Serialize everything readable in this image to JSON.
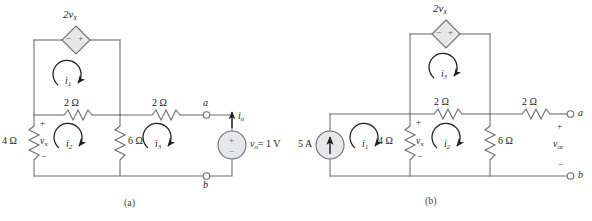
{
  "figure": {
    "type": "circuit-diagram",
    "background": "#ffffff",
    "wire_color": "#6d6e71",
    "text_color": "#231f20",
    "source_fill": "#e6e7e8",
    "panels": [
      {
        "id": "a",
        "caption": "(a)",
        "elements": {
          "dependent_source": {
            "label": "2v",
            "label_sub": "x",
            "polarity_left": "−",
            "polarity_right": "+",
            "shape": "diamond"
          },
          "mesh_currents": [
            {
              "name": "i",
              "sub": "1",
              "direction": "clockwise"
            },
            {
              "name": "i",
              "sub": "2",
              "direction": "clockwise"
            },
            {
              "name": "i",
              "sub": "3",
              "direction": "clockwise"
            }
          ],
          "resistors": [
            {
              "value": "4 Ω",
              "orientation": "vertical"
            },
            {
              "value": "2 Ω",
              "orientation": "horizontal"
            },
            {
              "value": "6 Ω",
              "orientation": "vertical"
            },
            {
              "value": "2 Ω",
              "orientation": "horizontal"
            }
          ],
          "vx_label": "v",
          "vx_sub": "x",
          "vx_plus": "+",
          "vx_minus": "−",
          "terminal_a": "a",
          "terminal_b": "b",
          "current_label": "i",
          "current_sub": "o",
          "voltage_source": {
            "text": "v",
            "sub": "o",
            "equals": "= 1 V",
            "plus": "+",
            "minus": "−"
          }
        }
      },
      {
        "id": "b",
        "caption": "(b)",
        "elements": {
          "dependent_source": {
            "label": "2v",
            "label_sub": "x",
            "polarity_left": "−",
            "polarity_right": "+",
            "shape": "diamond"
          },
          "current_source": {
            "value": "5 A",
            "direction": "up"
          },
          "mesh_currents": [
            {
              "name": "i",
              "sub": "1",
              "direction": "clockwise"
            },
            {
              "name": "i",
              "sub": "2",
              "direction": "clockwise"
            },
            {
              "name": "i",
              "sub": "3",
              "direction": "clockwise"
            }
          ],
          "resistors": [
            {
              "value": "4 Ω",
              "orientation": "vertical"
            },
            {
              "value": "2 Ω",
              "orientation": "horizontal"
            },
            {
              "value": "6 Ω",
              "orientation": "vertical"
            },
            {
              "value": "2 Ω",
              "orientation": "horizontal"
            }
          ],
          "vx_label": "v",
          "vx_sub": "x",
          "vx_plus": "+",
          "vx_minus": "−",
          "terminal_a": "a",
          "terminal_b": "b",
          "voc_label": "v",
          "voc_sub": "oc",
          "voc_plus": "+",
          "voc_minus": "−"
        }
      }
    ]
  }
}
